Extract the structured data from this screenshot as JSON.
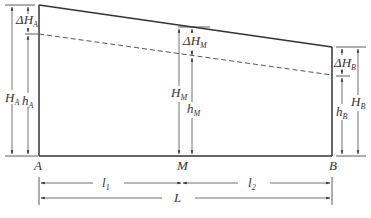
{
  "diagram": {
    "type": "hydraulic-head-profile",
    "points": {
      "A": "A",
      "M": "M",
      "B": "B"
    },
    "labels": {
      "dHA": {
        "main": "ΔH",
        "sub": "A"
      },
      "HA": {
        "main": "H",
        "sub": "A"
      },
      "hA": {
        "main": "h",
        "sub": "A"
      },
      "dHM": {
        "main": "ΔH",
        "sub": "M"
      },
      "HM": {
        "main": "H",
        "sub": "M"
      },
      "hM": {
        "main": "h",
        "sub": "M"
      },
      "dHB": {
        "main": "ΔH",
        "sub": "B"
      },
      "HB": {
        "main": "H",
        "sub": "B"
      },
      "hB": {
        "main": "h",
        "sub": "B"
      },
      "l1": {
        "main": "l",
        "sub": "1"
      },
      "l2": {
        "main": "l",
        "sub": "2"
      },
      "L": "L"
    },
    "colors": {
      "line": "#333333",
      "dashed": "#555555"
    }
  }
}
